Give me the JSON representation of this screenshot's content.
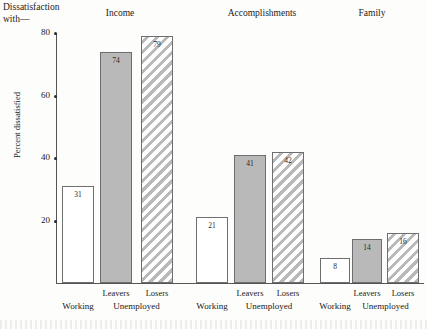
{
  "caption": "Dissatisfaction\nwith—",
  "chart_data": {
    "type": "bar",
    "title": "Dissatisfaction with—",
    "xlabel": "",
    "ylabel": "Percent dissatisfied",
    "ylim": [
      0,
      80
    ],
    "yticks": [
      20,
      40,
      60,
      80
    ],
    "ytick_labels": [
      "20",
      "40",
      "60",
      "80"
    ],
    "grid": false,
    "legend": "none",
    "categories": [
      "Income",
      "Accomplishments",
      "Family"
    ],
    "series": [
      {
        "name": "Working",
        "style": "white",
        "values": [
          31,
          21,
          8
        ]
      },
      {
        "name": "Leavers",
        "style": "gray",
        "values": [
          74,
          41,
          14
        ]
      },
      {
        "name": "Losers",
        "style": "hatch",
        "values": [
          79,
          42,
          16
        ]
      }
    ],
    "groups": [
      {
        "header": "Income",
        "bars": [
          {
            "label": "Working",
            "tier2": "Working",
            "value": 31,
            "style": "white"
          },
          {
            "label": "Leavers",
            "tier2": "Unemployed",
            "value": 74,
            "style": "gray"
          },
          {
            "label": "Losers",
            "tier2": "Unemployed",
            "value": 79,
            "style": "hatch"
          }
        ]
      },
      {
        "header": "Accomplishments",
        "bars": [
          {
            "label": "Working",
            "tier2": "Working",
            "value": 21,
            "style": "white"
          },
          {
            "label": "Leavers",
            "tier2": "Unemployed",
            "value": 41,
            "style": "gray"
          },
          {
            "label": "Losers",
            "tier2": "Unemployed",
            "value": 42,
            "style": "hatch"
          }
        ]
      },
      {
        "header": "Family",
        "bars": [
          {
            "label": "Working",
            "tier2": "Working",
            "value": 8,
            "style": "white"
          },
          {
            "label": "Leavers",
            "tier2": "Unemployed",
            "value": 14,
            "style": "gray"
          },
          {
            "label": "Losers",
            "tier2": "Unemployed",
            "value": 16,
            "style": "hatch"
          }
        ]
      }
    ]
  },
  "colors": {
    "paper": "#fdfdfb",
    "ink": "#1a1a1a",
    "axis": "#555555",
    "bar_outline": "#6e6e6e",
    "bar_gray": "#b9b9b9",
    "bar_white": "#ffffff"
  }
}
